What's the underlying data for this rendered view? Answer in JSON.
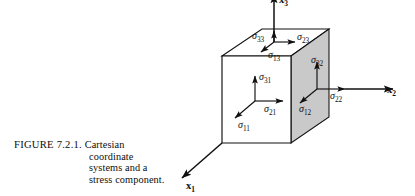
{
  "figure": {
    "caption_label": "FIGURE 7.2.1.",
    "caption_lines": [
      "Cartesian",
      "coordinate",
      "systems and a",
      "stress component."
    ],
    "caption_line_1": "Cartesian",
    "caption_line_2": "coordinate",
    "caption_line_3": "systems and a",
    "caption_line_4": "stress component."
  },
  "colors": {
    "ink": "#101010",
    "shaded_face": "#c9c9c9",
    "unshaded_face": "#ffffff",
    "background": "#ffffff"
  },
  "axes": [
    {
      "id": "x1",
      "base": "x",
      "subscript": "1",
      "direction": "down-left"
    },
    {
      "id": "x2",
      "base": "x",
      "subscript": "2",
      "direction": "right"
    },
    {
      "id": "x3",
      "base": "x",
      "subscript": "3",
      "direction": "up"
    }
  ],
  "axis_x1": {
    "base": "x",
    "sub": "1"
  },
  "axis_x2": {
    "base": "x",
    "sub": "2"
  },
  "axis_x3": {
    "base": "x",
    "sub": "3"
  },
  "stress_components": {
    "top_face": {
      "face_normal": "x3",
      "sigma_33": {
        "base": "σ",
        "sub": "33",
        "direction": "up"
      },
      "sigma_23": {
        "base": "σ",
        "sub": "23",
        "direction": "right"
      },
      "sigma_13": {
        "base": "σ",
        "sub": "13",
        "direction": "down-left"
      }
    },
    "front_face": {
      "face_normal": "x1",
      "sigma_31": {
        "base": "σ",
        "sub": "31",
        "direction": "up"
      },
      "sigma_21": {
        "base": "σ",
        "sub": "21",
        "direction": "right"
      },
      "sigma_11": {
        "base": "σ",
        "sub": "11",
        "direction": "down-left"
      }
    },
    "right_face": {
      "face_normal": "x2",
      "sigma_32": {
        "base": "σ",
        "sub": "32",
        "direction": "up"
      },
      "sigma_22": {
        "base": "σ",
        "sub": "22",
        "direction": "right"
      },
      "sigma_12": {
        "base": "σ",
        "sub": "12",
        "direction": "down-left"
      }
    }
  },
  "cube": {
    "description": "Cubic element with shaded right face",
    "shaded_face": "right"
  }
}
